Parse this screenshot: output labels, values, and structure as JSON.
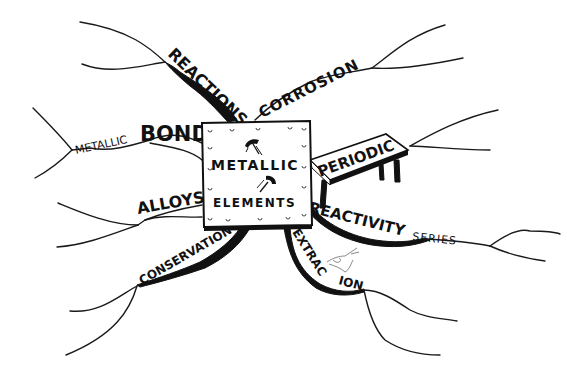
{
  "diagram": {
    "type": "mind-map",
    "style": "hand-drawn black ink on white",
    "colors": {
      "ink": "#111111",
      "background": "#ffffff"
    },
    "center": {
      "line1": "METALLIC",
      "line2": "ELEMENTS",
      "shape": "riveted metal plate",
      "icons": [
        "hammer-icon",
        "hammer-icon"
      ]
    },
    "branches": [
      {
        "id": "reactions",
        "label": "REACTIONS",
        "sub_label": ""
      },
      {
        "id": "corrosion",
        "label": "CORROSION",
        "sub_label": ""
      },
      {
        "id": "bond",
        "label": "BOND",
        "sub_label": "METALLIC"
      },
      {
        "id": "periodic",
        "label": "PERIODIC",
        "sub_label": "",
        "shape": "table"
      },
      {
        "id": "alloys",
        "label": "ALLOYS",
        "sub_label": ""
      },
      {
        "id": "reactivity",
        "label": "REACTIVITY",
        "sub_label": "SERIES"
      },
      {
        "id": "conservation",
        "label": "CONSERVATION",
        "sub_label": ""
      },
      {
        "id": "extraction",
        "label": "EXTRAC",
        "label_part2": "ION",
        "sub_label": "",
        "icon": "hand-icon"
      }
    ]
  }
}
